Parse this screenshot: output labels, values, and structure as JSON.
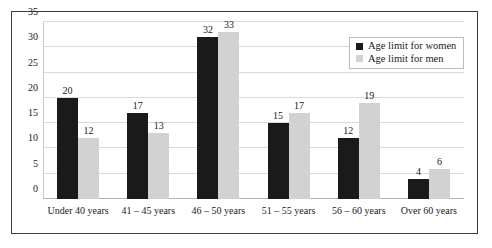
{
  "chart_data": {
    "type": "bar",
    "title": "",
    "xlabel": "",
    "ylabel": "",
    "ylim": [
      0,
      35
    ],
    "yticks": [
      0,
      5,
      10,
      15,
      20,
      25,
      30,
      35
    ],
    "grid": true,
    "legend_position": "top-right",
    "categories": [
      "Under 40 years",
      "41 – 45 years",
      "46 – 50 years",
      "51 – 55 years",
      "56 – 60 years",
      "Over 60 years"
    ],
    "series": [
      {
        "name": "Age limit for women",
        "color": "#1a1a1a",
        "values": [
          20,
          17,
          32,
          15,
          12,
          4
        ]
      },
      {
        "name": "Age limit for men",
        "color": "#d2d2d2",
        "values": [
          12,
          13,
          33,
          17,
          19,
          6
        ]
      }
    ]
  },
  "legend": {
    "items": [
      {
        "label": "Age limit for women"
      },
      {
        "label": "Age limit for men"
      }
    ]
  }
}
